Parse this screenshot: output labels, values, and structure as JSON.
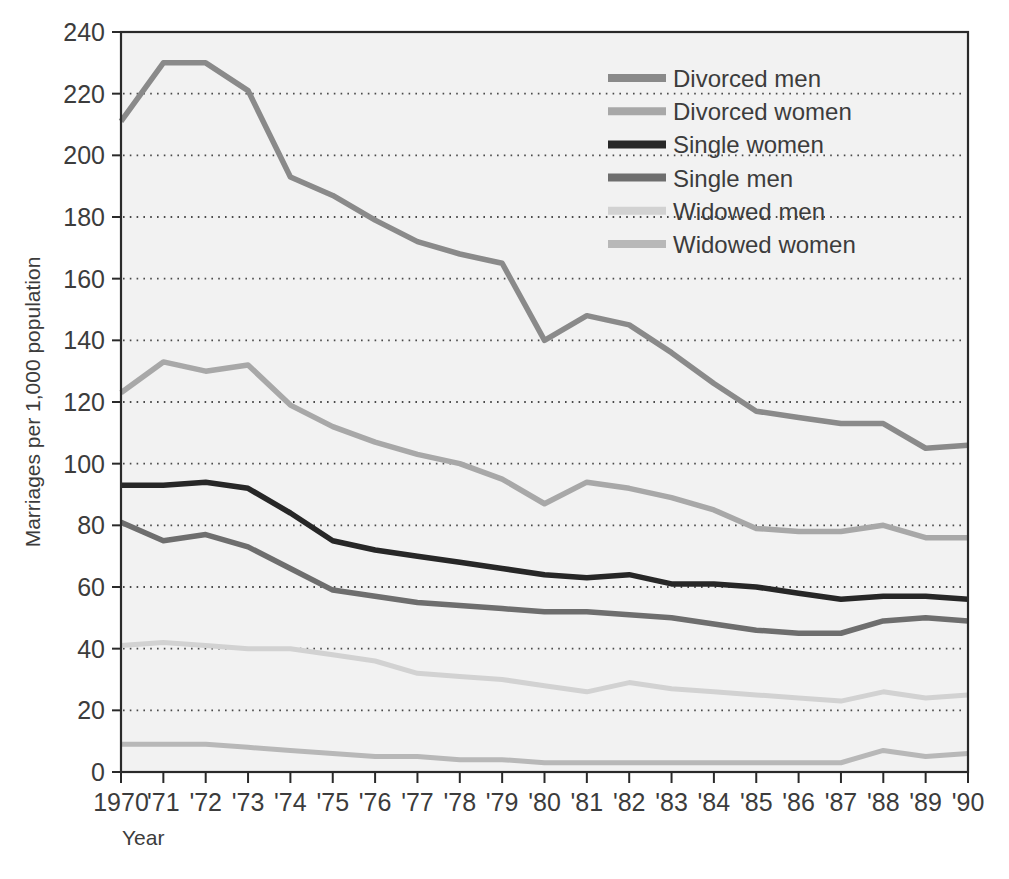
{
  "chart_data": {
    "type": "line",
    "title": "",
    "xlabel": "Year",
    "ylabel": "Marriages per 1,000 population",
    "xlim": [
      1970,
      1990
    ],
    "ylim": [
      0,
      240
    ],
    "ytick_step": 20,
    "grid": true,
    "grid_style": "dotted-horizontal",
    "legend_position": "upper-right-inside",
    "x": [
      1970,
      1971,
      1972,
      1973,
      1974,
      1975,
      1976,
      1977,
      1978,
      1979,
      1980,
      1981,
      1982,
      1983,
      1984,
      1985,
      1986,
      1987,
      1988,
      1989,
      1990
    ],
    "xtick_labels": [
      "1970",
      "'71",
      "'72",
      "'73",
      "'74",
      "'75",
      "'76",
      "'77",
      "'78",
      "'79",
      "'80",
      "'81",
      "'82",
      "'83",
      "'84",
      "'85",
      "'86",
      "'87",
      "'88",
      "'89",
      "'90"
    ],
    "ytick_labels": [
      "0",
      "20",
      "40",
      "60",
      "80",
      "100",
      "120",
      "140",
      "160",
      "180",
      "200",
      "220",
      "240"
    ],
    "series": [
      {
        "name": "Divorced men",
        "color": "#8a8a8a",
        "width": 5.5,
        "values": [
          211,
          230,
          230,
          221,
          193,
          187,
          179,
          172,
          168,
          165,
          140,
          148,
          145,
          136,
          126,
          117,
          115,
          113,
          113,
          105,
          106
        ]
      },
      {
        "name": "Divorced women",
        "color": "#a8a8a8",
        "width": 5.5,
        "values": [
          123,
          133,
          130,
          132,
          119,
          112,
          107,
          103,
          100,
          95,
          87,
          94,
          92,
          89,
          85,
          79,
          78,
          78,
          80,
          76,
          76
        ]
      },
      {
        "name": "Single women",
        "color": "#272727",
        "width": 5.5,
        "values": [
          93,
          93,
          94,
          92,
          84,
          75,
          72,
          70,
          68,
          66,
          64,
          63,
          64,
          61,
          61,
          60,
          58,
          56,
          57,
          57,
          56
        ]
      },
      {
        "name": "Single men",
        "color": "#6e6e6e",
        "width": 5.5,
        "values": [
          81,
          75,
          77,
          73,
          66,
          59,
          57,
          55,
          54,
          53,
          52,
          52,
          51,
          50,
          48,
          46,
          45,
          45,
          49,
          50,
          49
        ]
      },
      {
        "name": "Widowed men",
        "color": "#d2d2d2",
        "width": 5.0,
        "values": [
          41,
          42,
          41,
          40,
          40,
          38,
          36,
          32,
          31,
          30,
          28,
          26,
          29,
          27,
          26,
          25,
          24,
          23,
          26,
          24,
          25
        ]
      },
      {
        "name": "Widowed women",
        "color": "#b8b8b8",
        "width": 5.0,
        "values": [
          9,
          9,
          9,
          8,
          7,
          6,
          5,
          5,
          4,
          4,
          3,
          3,
          3,
          3,
          3,
          3,
          3,
          3,
          7,
          5,
          6
        ]
      }
    ],
    "legend_entries": [
      {
        "label": "Divorced men",
        "color": "#8a8a8a"
      },
      {
        "label": "Divorced women",
        "color": "#a8a8a8"
      },
      {
        "label": "Single women",
        "color": "#272727"
      },
      {
        "label": "Single men",
        "color": "#6e6e6e"
      },
      {
        "label": "Widowed men",
        "color": "#d2d2d2"
      },
      {
        "label": "Widowed women",
        "color": "#b8b8b8"
      }
    ]
  },
  "colors": {
    "plot_background": "#f2f2f2",
    "frame": "#2a2a2a",
    "grid": "#4a4a4a",
    "text": "#3c3c3c"
  }
}
